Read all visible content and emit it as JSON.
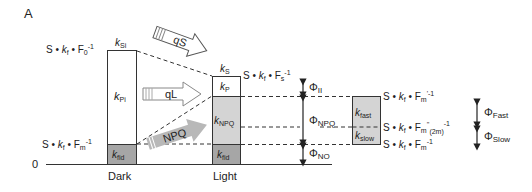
{
  "panel_label": "A",
  "zero_label": "0",
  "bars": {
    "dark": {
      "label": "Dark",
      "top_label": "k",
      "top_label_sub": "Si",
      "upper_section": {
        "k": "k",
        "sub": "Pi"
      },
      "lower_section": {
        "k": "k",
        "sub": "fid"
      }
    },
    "light": {
      "label": "Light",
      "top_label": "k",
      "top_label_sub": "S",
      "sections": [
        {
          "k": "k",
          "sub": "P"
        },
        {
          "k": "k",
          "sub": "NPQ"
        },
        {
          "k": "k",
          "sub": "fid"
        }
      ]
    },
    "relaxation": {
      "sections": [
        {
          "k": "k",
          "sub": "fast"
        },
        {
          "k": "k",
          "sub": "slow"
        }
      ]
    }
  },
  "equations": {
    "dark_top": {
      "prefix": "S • ",
      "kf": "k",
      "kf_sub": "f",
      "mid": " • F",
      "f_sub": "0",
      "sup": "-1"
    },
    "dark_bottom": {
      "prefix": "S • ",
      "kf": "k",
      "kf_sub": "f",
      "mid": " • F",
      "f_sub": "m",
      "sup": "-1"
    },
    "light_top": {
      "prefix": "S • ",
      "kf": "k",
      "kf_sub": "f",
      "mid": " • F",
      "f_sub": "s",
      "sup": "-1"
    },
    "relax_top": {
      "prefix": "S • ",
      "kf": "k",
      "kf_sub": "f",
      "mid": " • F",
      "f_sub": "m",
      "sup": "'-1"
    },
    "relax_mid": {
      "prefix": "S • ",
      "kf": "k",
      "kf_sub": "f",
      "mid": " • F",
      "f_sub": "m",
      "sup": "''",
      "sub2": "(2m)",
      "sup2": "-1"
    },
    "relax_bottom": {
      "prefix": "S • ",
      "kf": "k",
      "kf_sub": "f",
      "mid": " • F",
      "f_sub": "m",
      "sup": "-1"
    }
  },
  "arrows": {
    "qS": "qS",
    "qL": "qL",
    "NPQ": "NPQ"
  },
  "yields": {
    "phi": "Φ",
    "II": "II",
    "NPQ": "NPQ",
    "NO": "NO",
    "Fast": "Fast",
    "Slow": "Slow"
  },
  "colors": {
    "grey_dark": "#a6a6a6",
    "grey_light": "#d4d4d4",
    "line": "#333333",
    "arrow_grey": "#b8b8b8"
  }
}
